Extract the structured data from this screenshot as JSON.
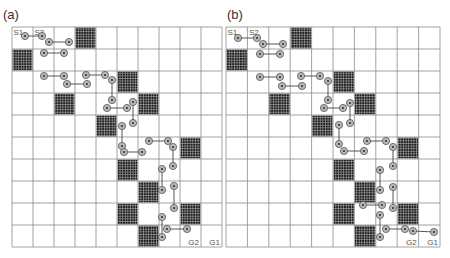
{
  "panels": [
    {
      "id": "a",
      "label": "(a)",
      "label_pos": [
        3,
        8
      ],
      "grid": {
        "x0": 12,
        "y0": 27,
        "x1": 222,
        "y1": 247,
        "cols": 10,
        "rows": 10
      },
      "start_labels": [
        {
          "text": "S1",
          "col": 0
        },
        {
          "text": "S2",
          "col": 1
        }
      ],
      "goal_labels": [
        {
          "text": "G2",
          "col": 8
        },
        {
          "text": "G1",
          "col": 9
        }
      ],
      "obstacles": [
        [
          0,
          3
        ],
        [
          1,
          0
        ],
        [
          2,
          5
        ],
        [
          3,
          2
        ],
        [
          3,
          6
        ],
        [
          4,
          4
        ],
        [
          5,
          8
        ],
        [
          6,
          5
        ],
        [
          7,
          6
        ],
        [
          8,
          5
        ],
        [
          8,
          8
        ],
        [
          9,
          6
        ]
      ],
      "edges": [
        [
          [
            25,
            36
          ],
          [
            42,
            36
          ]
        ],
        [
          [
            49,
            42
          ],
          [
            69,
            42
          ]
        ],
        [
          [
            44,
            53
          ],
          [
            64,
            53
          ]
        ],
        [
          [
            44,
            76
          ],
          [
            64,
            76
          ]
        ],
        [
          [
            67,
            84
          ],
          [
            87,
            84
          ]
        ],
        [
          [
            86,
            75
          ],
          [
            105,
            75
          ]
        ],
        [
          [
            112,
            80
          ],
          [
            112,
            100
          ]
        ],
        [
          [
            107,
            108
          ],
          [
            127,
            108
          ]
        ],
        [
          [
            133,
            102
          ],
          [
            133,
            123
          ]
        ],
        [
          [
            122,
            126
          ],
          [
            122,
            146
          ]
        ],
        [
          [
            124,
            152
          ],
          [
            142,
            152
          ]
        ],
        [
          [
            149,
            141
          ],
          [
            168,
            141
          ]
        ],
        [
          [
            173,
            147
          ],
          [
            173,
            166
          ]
        ],
        [
          [
            162,
            169
          ],
          [
            162,
            190
          ]
        ],
        [
          [
            174,
            186
          ],
          [
            174,
            208
          ]
        ],
        [
          [
            162,
            217
          ],
          [
            162,
            237
          ]
        ],
        [
          [
            167,
            229
          ],
          [
            187,
            229
          ]
        ]
      ],
      "nodes": [
        [
          25,
          36
        ],
        [
          42,
          36
        ],
        [
          49,
          42
        ],
        [
          69,
          42
        ],
        [
          44,
          53
        ],
        [
          64,
          53
        ],
        [
          44,
          76
        ],
        [
          64,
          76
        ],
        [
          67,
          84
        ],
        [
          87,
          84
        ],
        [
          86,
          75
        ],
        [
          105,
          75
        ],
        [
          112,
          80
        ],
        [
          112,
          100
        ],
        [
          107,
          108
        ],
        [
          127,
          108
        ],
        [
          133,
          102
        ],
        [
          133,
          123
        ],
        [
          122,
          126
        ],
        [
          122,
          146
        ],
        [
          124,
          152
        ],
        [
          142,
          152
        ],
        [
          149,
          141
        ],
        [
          168,
          141
        ],
        [
          173,
          147
        ],
        [
          173,
          166
        ],
        [
          162,
          169
        ],
        [
          162,
          190
        ],
        [
          174,
          186
        ],
        [
          174,
          208
        ],
        [
          162,
          217
        ],
        [
          162,
          237
        ],
        [
          167,
          229
        ],
        [
          187,
          229
        ]
      ]
    },
    {
      "id": "b",
      "label": "(b)",
      "label_pos": [
        227,
        8
      ],
      "grid": {
        "x0": 226,
        "y0": 27,
        "x1": 440,
        "y1": 247,
        "cols": 10,
        "rows": 10
      },
      "start_labels": [
        {
          "text": "S1",
          "col": 0
        },
        {
          "text": "S2",
          "col": 1
        }
      ],
      "goal_labels": [
        {
          "text": "G2",
          "col": 8
        },
        {
          "text": "G1",
          "col": 9
        }
      ],
      "obstacles": [
        [
          0,
          3
        ],
        [
          1,
          0
        ],
        [
          2,
          5
        ],
        [
          3,
          2
        ],
        [
          3,
          6
        ],
        [
          4,
          4
        ],
        [
          5,
          8
        ],
        [
          6,
          5
        ],
        [
          7,
          6
        ],
        [
          8,
          5
        ],
        [
          8,
          8
        ],
        [
          9,
          6
        ]
      ],
      "edges": [
        [
          [
            238,
            38
          ],
          [
            257,
            38
          ]
        ],
        [
          [
            263,
            44
          ],
          [
            283,
            44
          ]
        ],
        [
          [
            260,
            54
          ],
          [
            280,
            54
          ]
        ],
        [
          [
            260,
            77
          ],
          [
            280,
            77
          ]
        ],
        [
          [
            282,
            86
          ],
          [
            302,
            86
          ]
        ],
        [
          [
            301,
            76
          ],
          [
            320,
            76
          ]
        ],
        [
          [
            328,
            81
          ],
          [
            328,
            100
          ]
        ],
        [
          [
            324,
            108
          ],
          [
            343,
            108
          ]
        ],
        [
          [
            350,
            103
          ],
          [
            350,
            123
          ]
        ],
        [
          [
            339,
            125
          ],
          [
            339,
            144
          ]
        ],
        [
          [
            344,
            151
          ],
          [
            364,
            151
          ]
        ],
        [
          [
            367,
            141
          ],
          [
            386,
            141
          ]
        ],
        [
          [
            393,
            147
          ],
          [
            393,
            166
          ]
        ],
        [
          [
            380,
            170
          ],
          [
            380,
            190
          ]
        ],
        [
          [
            393,
            187
          ],
          [
            393,
            208
          ]
        ],
        [
          [
            363,
            205
          ],
          [
            382,
            205
          ]
        ],
        [
          [
            380,
            215
          ],
          [
            380,
            237
          ]
        ],
        [
          [
            386,
            229
          ],
          [
            405,
            229
          ]
        ],
        [
          [
            413,
            231
          ],
          [
            434,
            232
          ]
        ]
      ],
      "nodes": [
        [
          238,
          38
        ],
        [
          257,
          38
        ],
        [
          263,
          44
        ],
        [
          283,
          44
        ],
        [
          260,
          54
        ],
        [
          280,
          54
        ],
        [
          260,
          77
        ],
        [
          280,
          77
        ],
        [
          282,
          86
        ],
        [
          302,
          86
        ],
        [
          301,
          76
        ],
        [
          320,
          76
        ],
        [
          328,
          81
        ],
        [
          328,
          100
        ],
        [
          324,
          108
        ],
        [
          343,
          108
        ],
        [
          350,
          103
        ],
        [
          350,
          123
        ],
        [
          339,
          125
        ],
        [
          339,
          144
        ],
        [
          344,
          151
        ],
        [
          364,
          151
        ],
        [
          367,
          141
        ],
        [
          386,
          141
        ],
        [
          393,
          147
        ],
        [
          393,
          166
        ],
        [
          380,
          170
        ],
        [
          380,
          190
        ],
        [
          393,
          187
        ],
        [
          393,
          208
        ],
        [
          363,
          205
        ],
        [
          382,
          205
        ],
        [
          380,
          215
        ],
        [
          380,
          237
        ],
        [
          386,
          229
        ],
        [
          405,
          229
        ],
        [
          413,
          231
        ],
        [
          434,
          232
        ]
      ]
    }
  ],
  "colors": {
    "grid_line": "#8a8a8a",
    "obstacle_fill": "#1a1a1a",
    "obstacle_hatch": "#9a9a9a",
    "node_fill": "#b8b8b8",
    "node_stroke": "#555555",
    "edge": "#444444",
    "label": "#555555"
  }
}
